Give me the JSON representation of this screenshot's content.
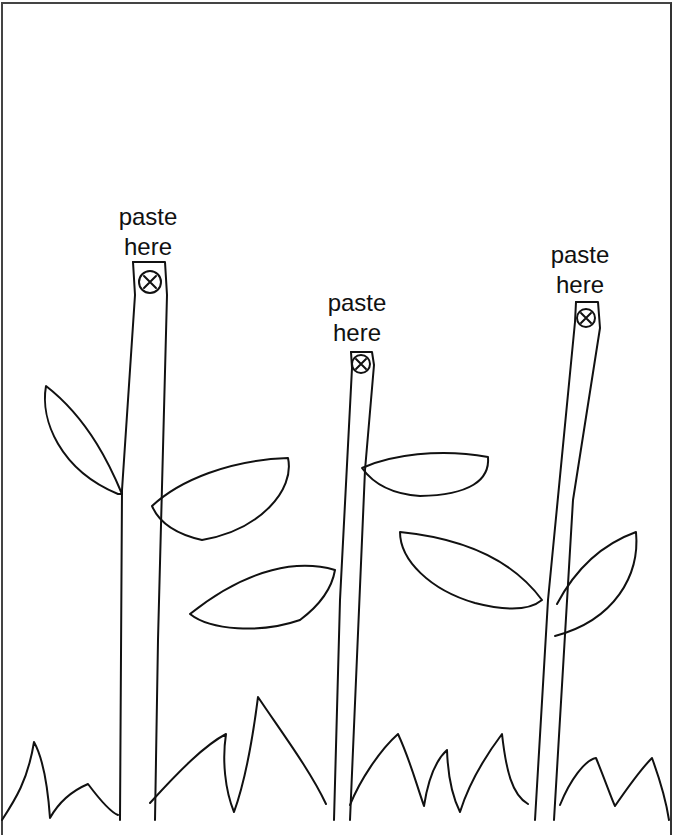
{
  "worksheet": {
    "stems": [
      {
        "id": "left",
        "label_line1": "paste",
        "label_line2": "here",
        "marker": "circle-x"
      },
      {
        "id": "middle",
        "label_line1": "paste",
        "label_line2": "here",
        "marker": "circle-x"
      },
      {
        "id": "right",
        "label_line1": "paste",
        "label_line2": "here",
        "marker": "circle-x"
      }
    ],
    "colors": {
      "background": "#ffffff",
      "ink": "#111111",
      "border": "#444444"
    }
  }
}
